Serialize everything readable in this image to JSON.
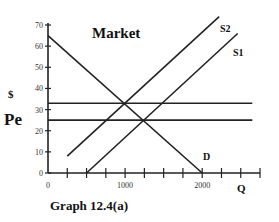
{
  "chart_data": {
    "type": "line",
    "title": "Market",
    "caption": "Graph 12.4(a)",
    "xlabel": "Q",
    "ylabel": "$",
    "xlim": [
      0,
      2750
    ],
    "ylim": [
      0,
      70
    ],
    "x_ticks": [
      0,
      250,
      500,
      750,
      1000,
      1250,
      1500,
      1750,
      2000,
      2250,
      2500,
      2750
    ],
    "x_tick_labels": [
      {
        "value": 0,
        "label": "0"
      },
      {
        "value": 1000,
        "label": "1000"
      },
      {
        "value": 2000,
        "label": "2000"
      }
    ],
    "y_ticks": [
      0,
      10,
      20,
      30,
      40,
      50,
      60,
      70
    ],
    "y_tick_labels": [
      "0",
      "10",
      "20",
      "30",
      "40",
      "50",
      "60",
      "70"
    ],
    "grid": false,
    "series": [
      {
        "name": "D",
        "points": [
          [
            0,
            65
          ],
          [
            2000,
            0
          ]
        ]
      },
      {
        "name": "S1",
        "points": [
          [
            500,
            0
          ],
          [
            2460,
            66
          ]
        ]
      },
      {
        "name": "S2",
        "points": [
          [
            250,
            8
          ],
          [
            2220,
            74
          ]
        ]
      }
    ],
    "horizontal_lines": [
      {
        "name": "price-33",
        "y": 33,
        "x_range": [
          0,
          2650
        ]
      },
      {
        "name": "Pe",
        "y": 25,
        "x_range": [
          0,
          2650
        ]
      }
    ],
    "annotations": [
      {
        "text": "Pe",
        "near_y": 25
      },
      {
        "text": "S1"
      },
      {
        "text": "S2"
      },
      {
        "text": "D"
      }
    ]
  }
}
